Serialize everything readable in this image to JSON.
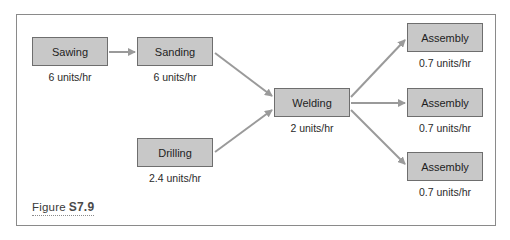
{
  "figure": {
    "label": "Figure",
    "number": "S7.9"
  },
  "colors": {
    "node_fill": "#c8c8c8",
    "node_border": "#6e6e6e",
    "arrow": "#9a9a9a",
    "frame": "#8a8a8a"
  },
  "nodes": [
    {
      "id": "sawing",
      "label": "Sawing",
      "rate": "6 units/hr"
    },
    {
      "id": "sanding",
      "label": "Sanding",
      "rate": "6 units/hr"
    },
    {
      "id": "drilling",
      "label": "Drilling",
      "rate": "2.4 units/hr"
    },
    {
      "id": "welding",
      "label": "Welding",
      "rate": "2 units/hr"
    },
    {
      "id": "assembly1",
      "label": "Assembly",
      "rate": "0.7 units/hr"
    },
    {
      "id": "assembly2",
      "label": "Assembly",
      "rate": "0.7 units/hr"
    },
    {
      "id": "assembly3",
      "label": "Assembly",
      "rate": "0.7 units/hr"
    }
  ],
  "edges": [
    {
      "from": "Sawing",
      "to": "Sanding"
    },
    {
      "from": "Sanding",
      "to": "Welding"
    },
    {
      "from": "Drilling",
      "to": "Welding"
    },
    {
      "from": "Welding",
      "to": "Assembly (top)"
    },
    {
      "from": "Welding",
      "to": "Assembly (middle)"
    },
    {
      "from": "Welding",
      "to": "Assembly (bottom)"
    }
  ]
}
